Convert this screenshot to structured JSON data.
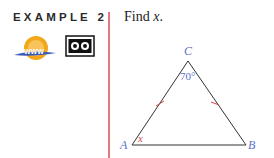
{
  "example": {
    "label": "EXAMPLE 2",
    "prompt_text": "Find ",
    "prompt_var": "x",
    "prompt_end": "."
  },
  "icons": [
    "www-icon",
    "video-icon"
  ],
  "figure": {
    "vertices": {
      "A": "A",
      "B": "B",
      "C": "C"
    },
    "angle_C": "70°",
    "angle_A": "x",
    "colors": {
      "vertex_label": "#5b6fc7",
      "angle_x": "#d9464a",
      "tick": "#d9464a",
      "divider": "#e0787e"
    }
  }
}
